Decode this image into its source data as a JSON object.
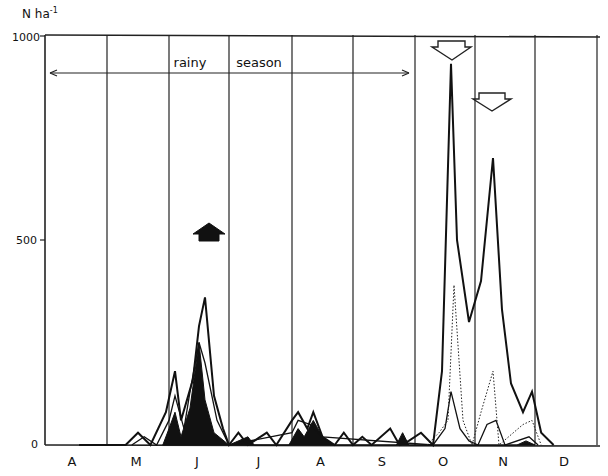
{
  "chart_data": {
    "type": "line",
    "title": "",
    "ylabel": "N ha-1",
    "xlabel": "",
    "ylim": [
      0,
      1000
    ],
    "yticks": [
      0,
      500,
      1000
    ],
    "ytick_labels": [
      "0",
      "500",
      "1000"
    ],
    "months": [
      "A",
      "M",
      "J",
      "J",
      "A",
      "S",
      "O",
      "N",
      "D"
    ],
    "grid": "vertical month dividers",
    "annotation": {
      "text_1": "rainy",
      "text_2": "season",
      "span": "late April to end of September (double-headed arrow)"
    },
    "markers": [
      {
        "type": "filled-up-arrow",
        "month": "J",
        "position": "mid June"
      },
      {
        "type": "open-down-arrow",
        "month": "O",
        "position": "late October"
      },
      {
        "type": "open-down-arrow",
        "month": "N",
        "position": "early-mid November"
      }
    ],
    "series": [
      {
        "name": "total (bold)",
        "style": "bold solid",
        "points": [
          [
            0.55,
            0
          ],
          [
            1.3,
            0
          ],
          [
            1.5,
            30
          ],
          [
            1.7,
            0
          ],
          [
            1.95,
            80
          ],
          [
            2.1,
            180
          ],
          [
            2.2,
            60
          ],
          [
            2.4,
            160
          ],
          [
            2.5,
            290
          ],
          [
            2.6,
            360
          ],
          [
            2.75,
            120
          ],
          [
            2.9,
            40
          ],
          [
            3.0,
            0
          ],
          [
            3.15,
            30
          ],
          [
            3.3,
            0
          ],
          [
            3.6,
            30
          ],
          [
            3.75,
            0
          ],
          [
            4.0,
            60
          ],
          [
            4.1,
            80
          ],
          [
            4.25,
            40
          ],
          [
            4.35,
            80
          ],
          [
            4.5,
            20
          ],
          [
            4.7,
            0
          ],
          [
            4.85,
            30
          ],
          [
            5.0,
            0
          ],
          [
            5.15,
            20
          ],
          [
            5.3,
            0
          ],
          [
            5.6,
            40
          ],
          [
            5.75,
            0
          ],
          [
            5.9,
            10
          ],
          [
            6.1,
            30
          ],
          [
            6.3,
            0
          ],
          [
            6.45,
            180
          ],
          [
            6.6,
            930
          ],
          [
            6.7,
            500
          ],
          [
            6.9,
            300
          ],
          [
            7.1,
            400
          ],
          [
            7.3,
            700
          ],
          [
            7.45,
            330
          ],
          [
            7.6,
            150
          ],
          [
            7.8,
            80
          ],
          [
            7.95,
            130
          ],
          [
            8.1,
            30
          ],
          [
            8.3,
            0
          ]
        ]
      },
      {
        "name": "dotted component",
        "style": "dotted",
        "points": [
          [
            6.2,
            0
          ],
          [
            6.4,
            30
          ],
          [
            6.55,
            60
          ],
          [
            6.65,
            390
          ],
          [
            6.8,
            60
          ],
          [
            6.95,
            0
          ],
          [
            7.1,
            80
          ],
          [
            7.3,
            180
          ],
          [
            7.4,
            0
          ],
          [
            7.8,
            50
          ],
          [
            7.95,
            60
          ],
          [
            8.1,
            0
          ]
        ]
      },
      {
        "name": "thin component",
        "style": "thin solid",
        "points": [
          [
            1.4,
            0
          ],
          [
            1.6,
            20
          ],
          [
            1.8,
            0
          ],
          [
            2.0,
            60
          ],
          [
            2.1,
            120
          ],
          [
            2.25,
            40
          ],
          [
            2.35,
            130
          ],
          [
            2.5,
            250
          ],
          [
            2.6,
            200
          ],
          [
            2.8,
            60
          ],
          [
            3.0,
            0
          ],
          [
            4.0,
            30
          ],
          [
            4.1,
            60
          ],
          [
            4.3,
            50
          ],
          [
            4.5,
            20
          ],
          [
            6.3,
            0
          ],
          [
            6.5,
            40
          ],
          [
            6.6,
            130
          ],
          [
            6.75,
            40
          ],
          [
            6.9,
            10
          ],
          [
            7.05,
            0
          ],
          [
            7.2,
            50
          ],
          [
            7.35,
            60
          ],
          [
            7.5,
            0
          ],
          [
            7.9,
            20
          ],
          [
            8.05,
            0
          ]
        ]
      },
      {
        "name": "filled component",
        "style": "black filled",
        "points": [
          [
            1.9,
            0
          ],
          [
            2.0,
            40
          ],
          [
            2.1,
            80
          ],
          [
            2.2,
            20
          ],
          [
            2.35,
            90
          ],
          [
            2.5,
            250
          ],
          [
            2.6,
            110
          ],
          [
            2.75,
            30
          ],
          [
            3.0,
            0
          ],
          [
            3.3,
            20
          ],
          [
            3.4,
            0
          ],
          [
            3.95,
            0
          ],
          [
            4.1,
            40
          ],
          [
            4.2,
            20
          ],
          [
            4.35,
            60
          ],
          [
            4.5,
            20
          ],
          [
            4.7,
            0
          ],
          [
            5.7,
            0
          ],
          [
            5.8,
            30
          ],
          [
            5.9,
            0
          ],
          [
            7.7,
            0
          ],
          [
            7.85,
            10
          ],
          [
            8.0,
            0
          ]
        ]
      }
    ]
  },
  "axis": {
    "y_unit": "N ha",
    "y_unit_exp": "-1",
    "y_labels": [
      "1000",
      "500",
      "0"
    ]
  },
  "annotations": {
    "rainy": "rainy",
    "season": "season"
  }
}
